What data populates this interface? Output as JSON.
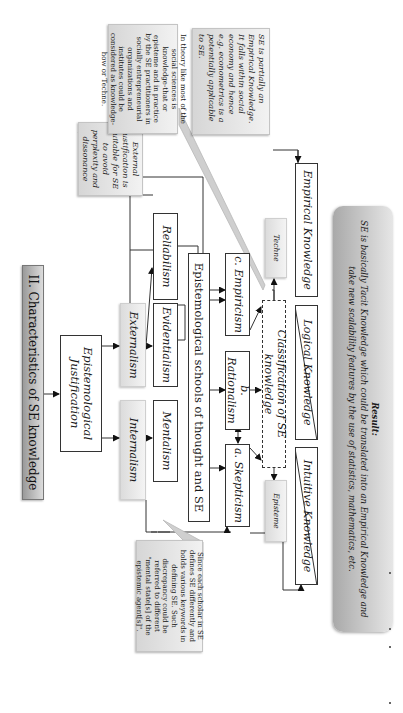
{
  "title": "II. Characteristics of SE knowledge",
  "justification": {
    "root": "Epistemological Justification",
    "branches": [
      {
        "label": "Internalism",
        "children": [
          "Mentalism"
        ]
      },
      {
        "label": "Externalism",
        "children": [
          "Evidentialism",
          "Reliabilism"
        ]
      }
    ]
  },
  "schools": {
    "label": "Epistemological schools of thought and SE",
    "items": [
      "a. Skepticism",
      "b. Rationalism",
      "c. Empiricism"
    ]
  },
  "classification": {
    "label": "Classification of SE knowledge",
    "episteme": "Episteme",
    "techne": "Techne"
  },
  "knowledge_types": [
    "Intuitive Knowledge",
    "Logical Knowledge",
    "Empirical Knowledge"
  ],
  "callouts": {
    "scholars": "Since each scholar in SE defines SE differently and holds various keywords in defining SE. Such discrepancy could be referred to different \"mental state[s] of the epistemic agent[s]\".",
    "external": "External justification is suitable for SE to avoid perplexity and dissonance",
    "theory": "In theory like most of the social sciences is knowledge-that or episteme and in practice by the SE practitioners in socially entrepreneurial organizations and institutes could be considered as knowledge-how or Techne.",
    "empirical": "SE is partially an Empirical Knowledge. It falls within social economy and hence e.g. econometrics is a potentially applicable to SE."
  },
  "result": {
    "heading": "Result:",
    "text": "SE is basically Tacit Knowledge which could be translated into an Empirical Knowledge and take new scalability features by the use of statistics, mathematics, etc."
  },
  "colors": {
    "line": "#333333",
    "callout_fill": "#dcdcdc",
    "result_fill": "#b5b5b5",
    "title_fill": "#a8a8a8"
  }
}
